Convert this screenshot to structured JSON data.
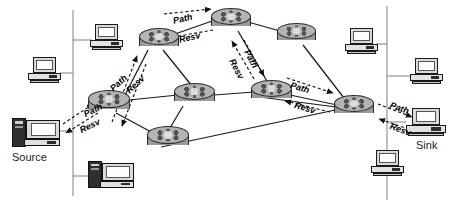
{
  "diagram": {
    "canvas": {
      "width": 460,
      "height": 214,
      "background": "#ffffff"
    },
    "colors": {
      "link": "#1a1a1a",
      "lan_line": "#8a8a8a",
      "router_fill": "#b3b3b3",
      "router_edge": "#2b2b2b",
      "text": "#000000"
    },
    "endpoints": [
      {
        "id": "source",
        "label": "Source",
        "x": 12,
        "y": 117,
        "w": 48,
        "h": 32
      },
      {
        "id": "sink",
        "label": "Sink",
        "x": 406,
        "y": 108,
        "w": 40,
        "h": 28
      }
    ],
    "hosts": [
      {
        "id": "host-top-left",
        "x": 90,
        "y": 24,
        "w": 33,
        "h": 26
      },
      {
        "id": "host-mid-left",
        "x": 28,
        "y": 57,
        "w": 33,
        "h": 26
      },
      {
        "id": "host-bottom-left",
        "x": 88,
        "y": 160,
        "w": 38,
        "h": 28
      },
      {
        "id": "host-top-right",
        "x": 345,
        "y": 28,
        "w": 33,
        "h": 26
      },
      {
        "id": "host-mid-right",
        "x": 410,
        "y": 58,
        "w": 33,
        "h": 26
      },
      {
        "id": "host-bottom-right",
        "x": 371,
        "y": 150,
        "w": 33,
        "h": 26
      }
    ],
    "routers": [
      {
        "id": "r-ingress",
        "x": 88,
        "y": 90,
        "w": 42,
        "h": 25
      },
      {
        "id": "r-upper-left",
        "x": 139,
        "y": 28,
        "w": 40,
        "h": 24
      },
      {
        "id": "r-top-mid",
        "x": 211,
        "y": 8,
        "w": 40,
        "h": 24
      },
      {
        "id": "r-top-right",
        "x": 277,
        "y": 23,
        "w": 39,
        "h": 23
      },
      {
        "id": "r-center",
        "x": 174,
        "y": 83,
        "w": 41,
        "h": 24
      },
      {
        "id": "r-right-mid",
        "x": 251,
        "y": 80,
        "w": 41,
        "h": 24
      },
      {
        "id": "r-egress",
        "x": 334,
        "y": 95,
        "w": 40,
        "h": 24
      },
      {
        "id": "r-bottom",
        "x": 147,
        "y": 126,
        "w": 42,
        "h": 25
      }
    ],
    "links": [
      {
        "from": "r-ingress",
        "to": "r-upper-left"
      },
      {
        "from": "r-ingress",
        "to": "r-center"
      },
      {
        "from": "r-ingress",
        "to": "r-bottom"
      },
      {
        "from": "r-upper-left",
        "to": "r-top-mid"
      },
      {
        "from": "r-upper-left",
        "to": "r-center"
      },
      {
        "from": "r-top-mid",
        "to": "r-top-right"
      },
      {
        "from": "r-top-mid",
        "to": "r-right-mid"
      },
      {
        "from": "r-top-right",
        "to": "r-egress"
      },
      {
        "from": "r-center",
        "to": "r-right-mid"
      },
      {
        "from": "r-center",
        "to": "r-bottom"
      },
      {
        "from": "r-right-mid",
        "to": "r-egress"
      },
      {
        "from": "r-bottom",
        "to": "r-egress"
      }
    ],
    "lan_segments": [
      {
        "id": "lan-left",
        "x": 73,
        "y1": 10,
        "y2": 196
      },
      {
        "id": "lan-right",
        "x": 387,
        "y1": 6,
        "y2": 200
      }
    ],
    "messages": [
      {
        "id": "msg-1-path",
        "text": "Path",
        "x": 82,
        "y": 110,
        "rotate": -26,
        "kind": "path"
      },
      {
        "id": "msg-1-resv",
        "text": "Resv",
        "x": 78,
        "y": 126,
        "rotate": -26,
        "kind": "resv"
      },
      {
        "id": "msg-2-path",
        "text": "Path",
        "x": 108,
        "y": 86,
        "rotate": -43,
        "kind": "path"
      },
      {
        "id": "msg-2-resv",
        "text": "Resv",
        "x": 124,
        "y": 88,
        "rotate": -43,
        "kind": "resv"
      },
      {
        "id": "msg-3-path",
        "text": "Path",
        "x": 172,
        "y": 16,
        "rotate": -13,
        "kind": "path"
      },
      {
        "id": "msg-3-resv",
        "text": "Resv",
        "x": 178,
        "y": 35,
        "rotate": -13,
        "kind": "resv"
      },
      {
        "id": "msg-4-path",
        "text": "Path",
        "x": 251,
        "y": 48,
        "rotate": 62,
        "kind": "path"
      },
      {
        "id": "msg-4-resv",
        "text": "Resv",
        "x": 236,
        "y": 57,
        "rotate": 62,
        "kind": "resv"
      },
      {
        "id": "msg-5-path",
        "text": "Path",
        "x": 292,
        "y": 80,
        "rotate": 17,
        "kind": "path"
      },
      {
        "id": "msg-5-resv",
        "text": "Resv",
        "x": 296,
        "y": 100,
        "rotate": 17,
        "kind": "resv"
      },
      {
        "id": "msg-6-path",
        "text": "Path",
        "x": 392,
        "y": 100,
        "rotate": 20,
        "kind": "path"
      },
      {
        "id": "msg-6-resv",
        "text": "Resv",
        "x": 392,
        "y": 121,
        "rotate": 20,
        "kind": "resv"
      }
    ]
  }
}
